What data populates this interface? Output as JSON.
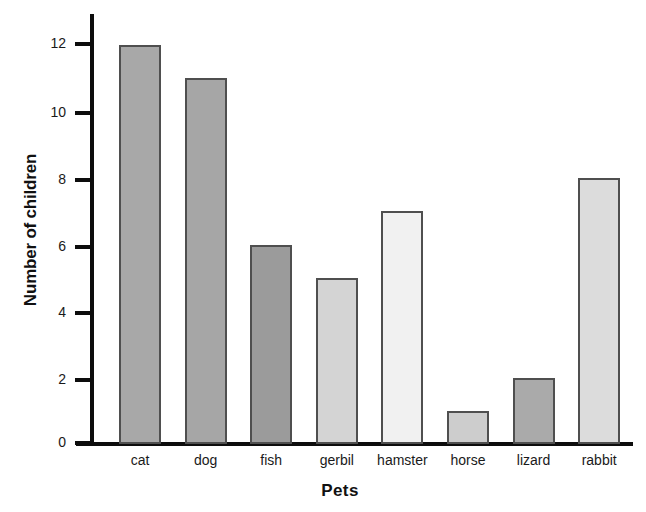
{
  "chart_data": {
    "type": "bar",
    "title": "",
    "xlabel": "Pets",
    "ylabel": "Number of children",
    "categories": [
      "cat",
      "dog",
      "fish",
      "gerbil",
      "hamster",
      "horse",
      "lizard",
      "rabbit"
    ],
    "values": [
      12,
      11,
      6,
      5,
      7,
      1,
      2,
      8
    ],
    "ylim": [
      0,
      13
    ],
    "ytick_labels": [
      "0",
      "2",
      "4",
      "6",
      "8",
      "10",
      "12"
    ],
    "ytick_values": [
      0,
      2,
      4,
      6,
      8,
      10,
      12
    ],
    "grid": false,
    "legend": null,
    "bar_colors": [
      "#a8a8a8",
      "#a6a6a6",
      "#9b9b9b",
      "#d4d4d4",
      "#f1f1f1",
      "#cdcdcd",
      "#aaaaaa",
      "#dcdcdc"
    ],
    "bar_border_color": "#4f4f4f",
    "axis_color": "#0d0d0d",
    "background_color": "#ffffff",
    "text_color": "#1a1a1a"
  }
}
